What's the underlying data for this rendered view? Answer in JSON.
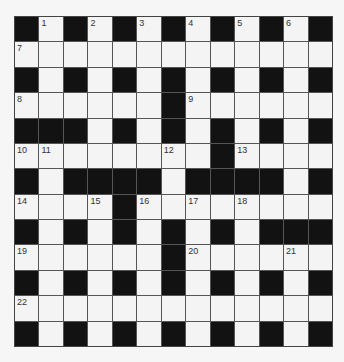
{
  "puzzle": {
    "rows": 13,
    "cols": 13,
    "grid": [
      [
        "#",
        "1",
        "#",
        "2",
        "#",
        "3",
        "#",
        "4",
        "#",
        "5",
        "#",
        "6",
        "#"
      ],
      [
        "7",
        ".",
        ".",
        ".",
        ".",
        ".",
        ".",
        ".",
        ".",
        ".",
        ".",
        ".",
        "."
      ],
      [
        "#",
        ".",
        "#",
        ".",
        "#",
        ".",
        "#",
        ".",
        "#",
        ".",
        "#",
        ".",
        "#"
      ],
      [
        "8",
        ".",
        ".",
        ".",
        ".",
        ".",
        "#",
        "9",
        ".",
        ".",
        ".",
        ".",
        "."
      ],
      [
        "#",
        "#",
        "#",
        ".",
        "#",
        ".",
        "#",
        ".",
        "#",
        ".",
        "#",
        ".",
        "#"
      ],
      [
        "10",
        "11",
        ".",
        ".",
        ".",
        ".",
        "12",
        ".",
        "#",
        "13",
        ".",
        ".",
        "."
      ],
      [
        "#",
        ".",
        "#",
        "#",
        "#",
        "#",
        ".",
        "#",
        "#",
        "#",
        "#",
        ".",
        "#"
      ],
      [
        "14",
        ".",
        ".",
        "15",
        "#",
        "16",
        ".",
        "17",
        ".",
        "18",
        ".",
        ".",
        "."
      ],
      [
        "#",
        ".",
        "#",
        ".",
        "#",
        ".",
        "#",
        ".",
        "#",
        ".",
        "#",
        "#",
        "#"
      ],
      [
        "19",
        ".",
        ".",
        ".",
        ".",
        ".",
        "#",
        "20",
        ".",
        ".",
        ".",
        "21",
        "."
      ],
      [
        "#",
        ".",
        "#",
        ".",
        "#",
        ".",
        "#",
        ".",
        "#",
        ".",
        "#",
        ".",
        "#"
      ],
      [
        "22",
        ".",
        ".",
        ".",
        ".",
        ".",
        ".",
        ".",
        ".",
        ".",
        ".",
        ".",
        "."
      ],
      [
        "#",
        ".",
        "#",
        ".",
        "#",
        ".",
        "#",
        ".",
        "#",
        ".",
        "#",
        ".",
        "#"
      ]
    ],
    "colors": {
      "black_cell": "#121212",
      "white_cell": "#f4f4f4",
      "grid_line": "#555555",
      "number_text": "#333333",
      "background": "#f6f6f6"
    }
  }
}
